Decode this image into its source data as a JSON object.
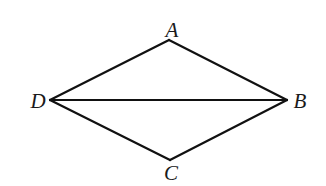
{
  "diagram": {
    "type": "quadrilateral-with-diagonal",
    "stroke_color": "#111111",
    "background": "#ffffff",
    "vertices": {
      "A": {
        "label": "A",
        "x": 169,
        "y": 40,
        "label_x": 172,
        "label_y": 37
      },
      "B": {
        "label": "B",
        "x": 287,
        "y": 100,
        "label_x": 300,
        "label_y": 108
      },
      "C": {
        "label": "C",
        "x": 170,
        "y": 160,
        "label_x": 171,
        "label_y": 180
      },
      "D": {
        "label": "D",
        "x": 50,
        "y": 100,
        "label_x": 38,
        "label_y": 108
      }
    },
    "edges": [
      {
        "name": "AB",
        "from": "A",
        "to": "B"
      },
      {
        "name": "BC",
        "from": "B",
        "to": "C"
      },
      {
        "name": "CD",
        "from": "C",
        "to": "D"
      },
      {
        "name": "DA",
        "from": "D",
        "to": "A"
      },
      {
        "name": "DB",
        "from": "D",
        "to": "B"
      }
    ]
  }
}
